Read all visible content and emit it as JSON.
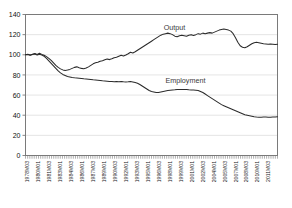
{
  "chart_data": {
    "type": "line",
    "title": "",
    "xlabel": "",
    "ylabel": "",
    "ylim": [
      0,
      140
    ],
    "ytick_step": 20,
    "yticks": [
      0,
      20,
      40,
      60,
      80,
      100,
      120,
      140
    ],
    "grid": true,
    "legend_position": "inline-annotations",
    "index_base": 100,
    "annotations": [
      {
        "name": "Output",
        "x_label": "1998M01",
        "y": 125
      },
      {
        "name": "Employment",
        "x_label": "1999M03",
        "y": 72
      }
    ],
    "xtick_labels": [
      "1978M03",
      "1980M01",
      "1981M03",
      "1983M01",
      "1984M03",
      "1986M01",
      "1987M03",
      "1989M01",
      "1990M03",
      "1992M01",
      "1993M03",
      "1995M01",
      "1996M03",
      "1998M01",
      "1999M03",
      "2001M01",
      "2002M03",
      "2004M01",
      "2005M03",
      "2007M01",
      "2008M03",
      "2010M01",
      "2011M03"
    ],
    "x_start": "1978M03",
    "x_end": "2012M09",
    "series": [
      {
        "name": "Output",
        "color": "#2b2b2b",
        "values": [
          100,
          100.5,
          99.8,
          100.6,
          101.2,
          100.2,
          101.5,
          100.4,
          99.5,
          98.2,
          96.5,
          94.5,
          92.0,
          89.5,
          87.5,
          86.0,
          85.0,
          84.5,
          84.8,
          85.5,
          86.5,
          87.5,
          88.0,
          87.2,
          86.5,
          86.2,
          86.8,
          88.0,
          89.5,
          91.0,
          92.0,
          92.5,
          93.5,
          94.0,
          95.0,
          95.8,
          95.2,
          96.0,
          97.0,
          97.5,
          98.5,
          99.5,
          98.8,
          99.8,
          101.0,
          102.5,
          101.8,
          103.0,
          104.5,
          106.0,
          107.5,
          109.0,
          110.5,
          112.0,
          113.5,
          115.0,
          116.5,
          118.0,
          119.5,
          120.5,
          121.0,
          121.5,
          121.0,
          120.0,
          118.5,
          118.0,
          119.0,
          119.5,
          119.0,
          118.5,
          119.5,
          120.0,
          119.2,
          120.0,
          121.0,
          120.5,
          121.5,
          121.0,
          121.5,
          122.0,
          121.5,
          122.5,
          123.5,
          124.5,
          125.0,
          125.5,
          125.0,
          124.5,
          123.5,
          121.0,
          117.0,
          112.5,
          109.0,
          107.5,
          107.0,
          108.0,
          109.5,
          111.0,
          112.0,
          112.5,
          112.0,
          111.5,
          111.0,
          110.8,
          110.5,
          110.8,
          110.5,
          110.2,
          110.5
        ]
      },
      {
        "name": "Employment",
        "color": "#2b2b2b",
        "values": [
          100,
          100.2,
          99.6,
          100.3,
          100.8,
          99.9,
          100.5,
          99.8,
          98.5,
          96.5,
          94.0,
          91.5,
          89.0,
          86.5,
          84.0,
          82.0,
          80.5,
          79.5,
          78.5,
          78.0,
          77.5,
          77.2,
          77.0,
          76.8,
          76.5,
          76.2,
          76.0,
          75.8,
          75.5,
          75.2,
          75.0,
          74.8,
          74.5,
          74.2,
          74.0,
          73.8,
          73.5,
          73.5,
          73.2,
          73.5,
          73.2,
          73.5,
          73.2,
          73.0,
          73.2,
          73.5,
          73.0,
          72.5,
          71.8,
          70.5,
          69.0,
          67.5,
          66.0,
          64.5,
          63.5,
          63.0,
          62.5,
          62.5,
          63.0,
          63.5,
          64.0,
          64.5,
          64.8,
          65.0,
          65.2,
          65.5,
          65.5,
          65.5,
          65.5,
          65.5,
          65.2,
          65.0,
          65.0,
          64.8,
          64.5,
          63.5,
          62.5,
          61.0,
          59.5,
          58.0,
          56.5,
          55.0,
          53.5,
          52.0,
          50.5,
          49.5,
          48.5,
          47.5,
          46.5,
          45.5,
          44.5,
          43.5,
          42.5,
          41.5,
          40.5,
          40.0,
          39.5,
          39.0,
          38.5,
          38.2,
          38.0,
          38.0,
          38.2,
          38.2,
          38.0,
          38.0,
          38.2,
          38.2,
          38.5
        ]
      }
    ]
  }
}
